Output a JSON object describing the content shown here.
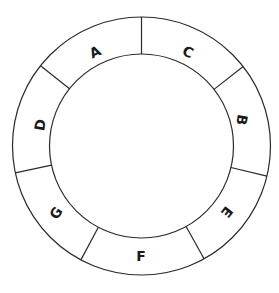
{
  "diagram": {
    "type": "segmented-ring",
    "center": [
      141.5,
      146
    ],
    "outer_radius": 129,
    "inner_radius": 92,
    "stroke_color": "#2a2a2a",
    "label_color": "#1a1a1a",
    "background_color": "#ffffff",
    "divider_angles_deg_clockwise_from_top": [
      0,
      52,
      103.5,
      151,
      208,
      258,
      308.5
    ],
    "segments": [
      {
        "label": "C",
        "start": 0,
        "end": 52,
        "label_pos": [
          188,
          52
        ],
        "label_rotation": 25
      },
      {
        "label": "B",
        "start": 52,
        "end": 103.5,
        "label_pos": [
          242,
          120
        ],
        "label_rotation": 100
      },
      {
        "label": "E",
        "start": 103.5,
        "end": 151,
        "label_pos": [
          227,
          212
        ],
        "label_rotation": 128
      },
      {
        "label": "F",
        "start": 151,
        "end": 208,
        "label_pos": [
          141,
          256
        ],
        "label_rotation": 0
      },
      {
        "label": "G",
        "start": 208,
        "end": 258,
        "label_pos": [
          56,
          213
        ],
        "label_rotation": -55
      },
      {
        "label": "D",
        "start": 258,
        "end": 308.5,
        "label_pos": [
          40,
          125
        ],
        "label_rotation": -80
      },
      {
        "label": "A",
        "start": 308.5,
        "end": 360,
        "label_pos": [
          95,
          52
        ],
        "label_rotation": -25
      }
    ]
  }
}
